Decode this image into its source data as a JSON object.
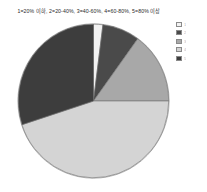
{
  "chart_data": {
    "type": "pie",
    "title": "1=20% 이하, 2=20-40%, 3=40-60%, 4=60-80%, 5=80% 이상",
    "xlabel": "",
    "ylabel": "",
    "legend_position": "right",
    "grid": false,
    "categories": [
      "1",
      "2",
      "3",
      "4",
      "5"
    ],
    "values": [
      2,
      8,
      15,
      45,
      30
    ],
    "colors": [
      "#f2f2f2",
      "#4a4a4a",
      "#a8a8a8",
      "#d4d4d4",
      "#3d3d3d"
    ],
    "slices": [
      {
        "label": "1",
        "value": 2,
        "color": "#f2f2f2",
        "start_angle": 0,
        "end_angle": 7.2
      },
      {
        "label": "2",
        "value": 8,
        "color": "#4a4a4a",
        "start_angle": 7.2,
        "end_angle": 36.0
      },
      {
        "label": "3",
        "value": 15,
        "color": "#a8a8a8",
        "start_angle": 36.0,
        "end_angle": 90.0
      },
      {
        "label": "4",
        "value": 45,
        "color": "#d4d4d4",
        "start_angle": 90.0,
        "end_angle": 252.0
      },
      {
        "label": "5",
        "value": 30,
        "color": "#3d3d3d",
        "start_angle": 252.0,
        "end_angle": 360.0
      }
    ]
  },
  "legend": {
    "entries": [
      {
        "swatch": "#f2f2f2",
        "label": "1"
      },
      {
        "swatch": "#4a4a4a",
        "label": "2"
      },
      {
        "swatch": "#a8a8a8",
        "label": "3"
      },
      {
        "swatch": "#d4d4d4",
        "label": "4"
      },
      {
        "swatch": "#3d3d3d",
        "label": "5"
      }
    ]
  }
}
